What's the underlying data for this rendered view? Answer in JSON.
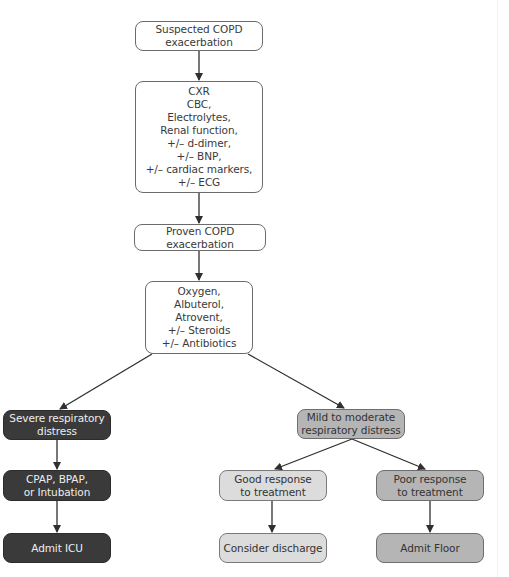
{
  "diagram": {
    "type": "flowchart",
    "nodes": {
      "suspected": {
        "label": "Suspected COPD\nexacerbation",
        "style": "white"
      },
      "workup": {
        "label": "CXR\nCBC,\nElectrolytes,\nRenal function,\n+/– d-dimer,\n+/– BNP,\n+/– cardiac markers,\n+/– ECG",
        "style": "white"
      },
      "proven": {
        "label": "Proven COPD exacerbation",
        "style": "white"
      },
      "treatment": {
        "label": "Oxygen,\nAlbuterol,\nAtrovent,\n+/– Steroids\n+/– Antibiotics",
        "style": "white"
      },
      "severe": {
        "label": "Severe respiratory\ndistress",
        "style": "dark"
      },
      "ventilation": {
        "label": "CPAP, BPAP,\nor Intubation",
        "style": "dark"
      },
      "admit_icu": {
        "label": "Admit ICU",
        "style": "dark"
      },
      "mild": {
        "label": "Mild to moderate\nrespiratory distress",
        "style": "mid"
      },
      "good_response": {
        "label": "Good response\nto treatment",
        "style": "light"
      },
      "discharge": {
        "label": "Consider discharge",
        "style": "light"
      },
      "poor_response": {
        "label": "Poor response\nto treatment",
        "style": "mid"
      },
      "admit_floor": {
        "label": "Admit Floor",
        "style": "mid"
      }
    },
    "edges": [
      [
        "suspected",
        "workup"
      ],
      [
        "workup",
        "proven"
      ],
      [
        "proven",
        "treatment"
      ],
      [
        "treatment",
        "severe"
      ],
      [
        "treatment",
        "mild"
      ],
      [
        "severe",
        "ventilation"
      ],
      [
        "ventilation",
        "admit_icu"
      ],
      [
        "mild",
        "good_response"
      ],
      [
        "mild",
        "poor_response"
      ],
      [
        "good_response",
        "discharge"
      ],
      [
        "poor_response",
        "admit_floor"
      ]
    ],
    "colors": {
      "dark_fill": "#3a3a3a",
      "mid_fill": "#b5b5b5",
      "light_fill": "#dcdcdc",
      "white_fill": "#ffffff",
      "line": "#2f2f2f"
    }
  }
}
